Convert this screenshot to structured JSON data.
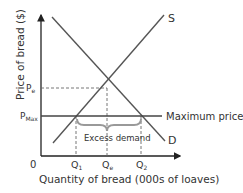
{
  "diagram": {
    "type": "supply-demand-maximum-price",
    "y_axis_label": "Price of bread ($)",
    "x_axis_label": "Quantity of bread (000s of loaves)",
    "origin_label": "0",
    "supply_label": "S",
    "demand_label": "D",
    "price_labels": {
      "equilibrium": "P",
      "equilibrium_sub": "e",
      "max": "P",
      "max_sub": "Max"
    },
    "quantity_labels": {
      "q1": "Q",
      "q1_sub": "1",
      "qe": "Q",
      "qe_sub": "e",
      "q2": "Q",
      "q2_sub": "2"
    },
    "max_price_label": "Maximum price",
    "excess_demand_label": "Excess demand",
    "colors": {
      "lines": "#555555",
      "axis": "#222222",
      "excess_brace": "#999999",
      "max_price_line": "#444444"
    }
  }
}
